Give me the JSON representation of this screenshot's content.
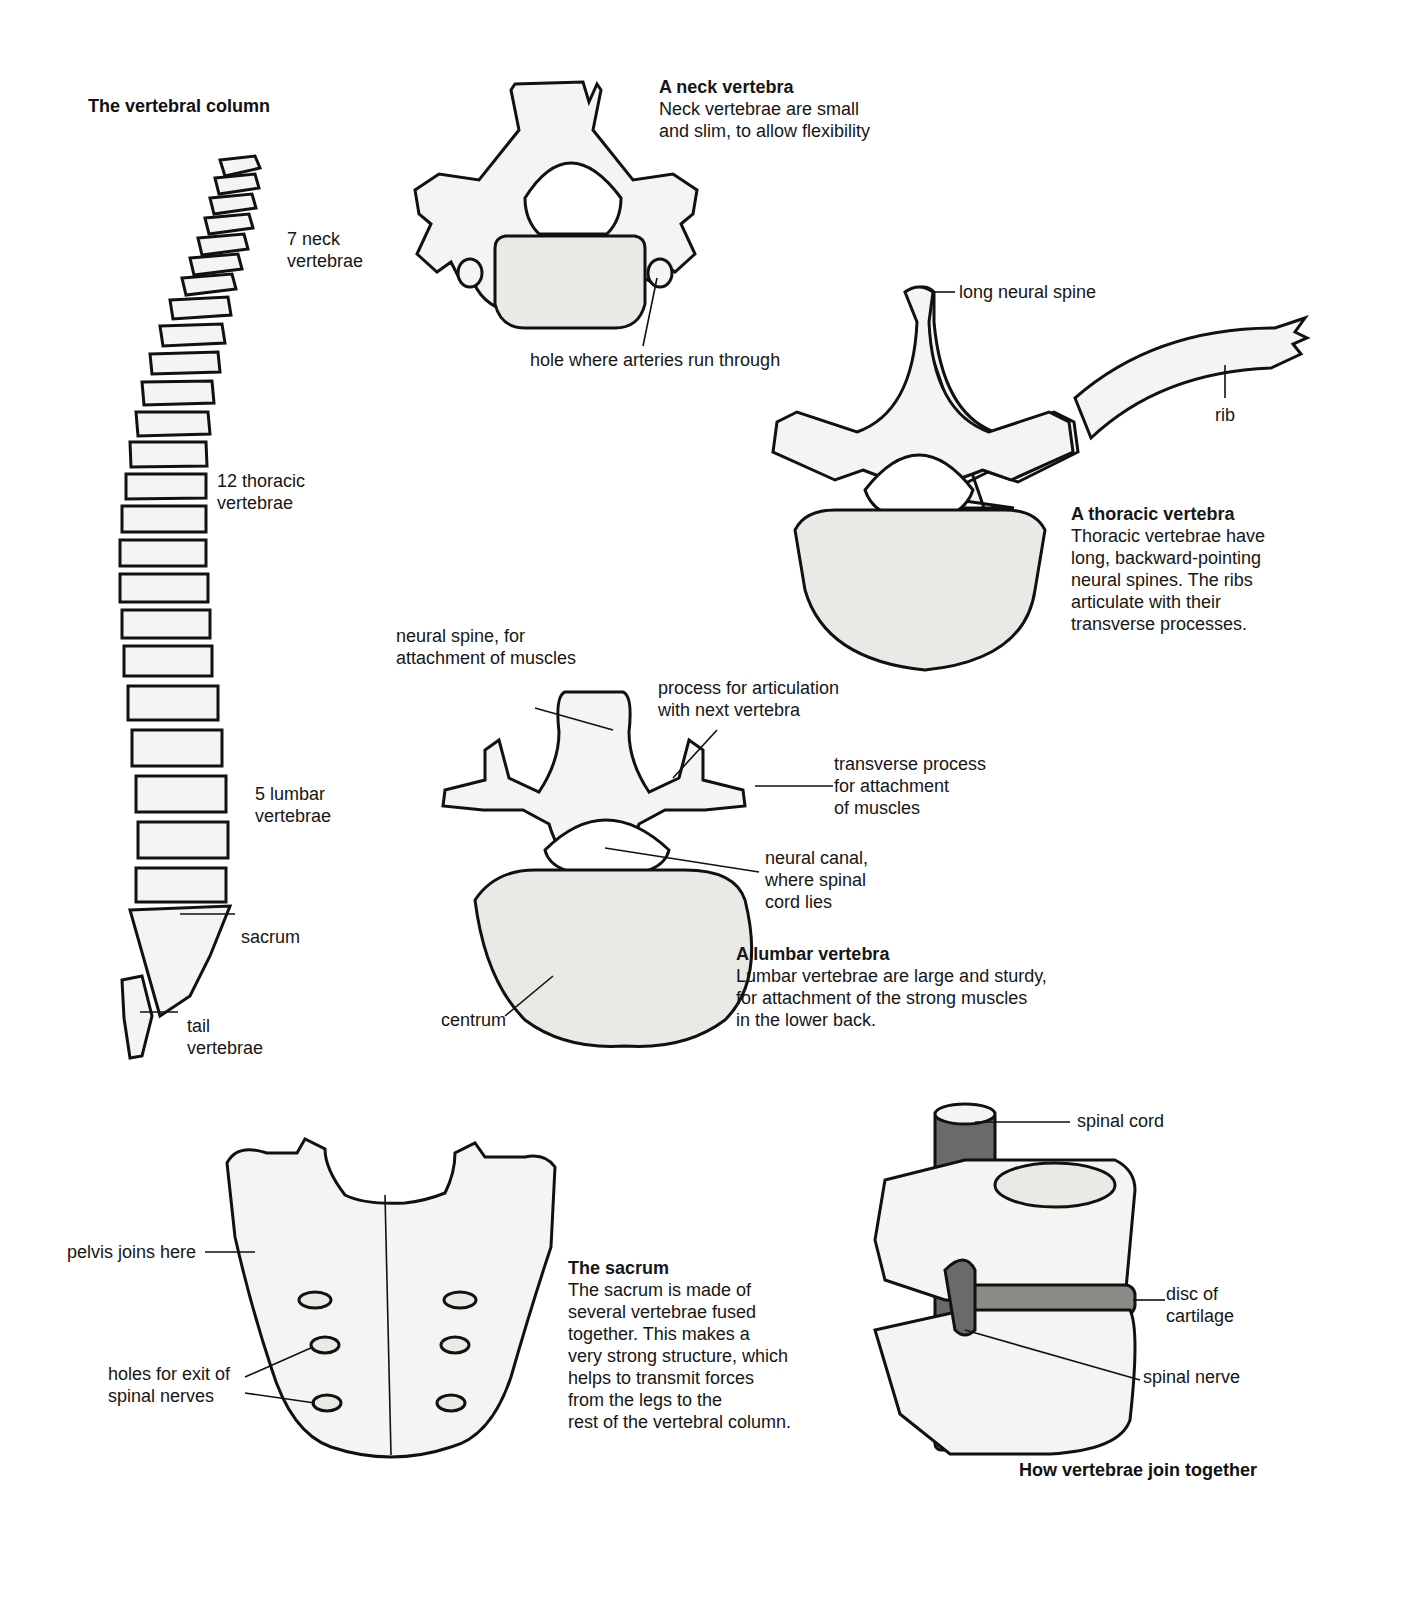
{
  "vertebral_column": {
    "title": "The vertebral column",
    "labels": {
      "neck": "7 neck\nvertebrae",
      "thoracic": "12 thoracic\nvertebrae",
      "lumbar": "5 lumbar\nvertebrae",
      "sacrum": "sacrum",
      "tail": "tail\nvertebrae"
    }
  },
  "neck_vertebra": {
    "title": "A neck vertebra",
    "description": "Neck vertebrae are small\nand slim, to allow flexibility",
    "labels": {
      "hole": "hole where arteries run through"
    }
  },
  "thoracic_vertebra": {
    "title": "A thoracic vertebra",
    "description": "Thoracic vertebrae have\nlong, backward-pointing\nneural spines. The ribs\narticulate with their\ntransverse processes.",
    "labels": {
      "spine": "long neural spine",
      "rib": "rib"
    }
  },
  "lumbar_vertebra": {
    "title": "A lumbar vertebra",
    "description": "Lumbar vertebrae are large and sturdy,\nfor attachment of the strong muscles\nin the lower back.",
    "labels": {
      "neural_spine": "neural spine, for\nattachment of muscles",
      "articulation": "process for articulation\nwith next vertebra",
      "transverse": "transverse process\nfor attachment\nof muscles",
      "canal": "neural canal,\nwhere spinal\ncord lies",
      "centrum": "centrum"
    }
  },
  "sacrum": {
    "title": "The sacrum",
    "description": "The sacrum is made of\nseveral vertebrae fused\ntogether. This makes a\nvery strong structure, which\nhelps to transmit forces\nfrom the legs to the\nrest of the vertebral column.",
    "labels": {
      "pelvis": "pelvis joins here",
      "holes": "holes for exit of\nspinal nerves"
    }
  },
  "joining": {
    "title": "How vertebrae join together",
    "labels": {
      "cord": "spinal cord",
      "disc": "disc of\ncartilage",
      "nerve": "spinal nerve"
    }
  }
}
